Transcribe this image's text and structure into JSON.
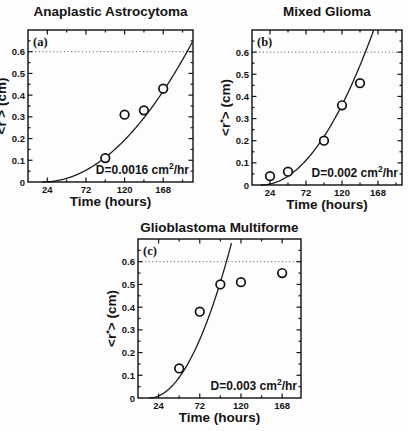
{
  "chart_data": [
    {
      "panel": "a",
      "panel_label": "(a)",
      "type": "scatter",
      "title": "Anaplastic Astrocytoma",
      "xlabel": "Time (hours)",
      "ylabel": "<r*> (cm)",
      "xlim": [
        0,
        205
      ],
      "ylim": [
        0,
        0.7
      ],
      "x_ticks": [
        24,
        72,
        120,
        168
      ],
      "y_ticks": [
        0,
        0.1,
        0.2,
        0.3,
        0.4,
        0.5,
        0.6
      ],
      "threshold_y": 0.6,
      "points": [
        {
          "t": 96,
          "r": 0.11
        },
        {
          "t": 120,
          "r": 0.31
        },
        {
          "t": 144,
          "r": 0.33
        },
        {
          "t": 168,
          "r": 0.43
        }
      ],
      "fit_curve": {
        "form": "r = a*(t-t0)^2",
        "t0": 18,
        "a": 1.86e-05
      },
      "annotation": {
        "text": "D=0.0016 cm^2/hr",
        "prefix": "D=0.0016 cm",
        "sup": "2",
        "suffix": "/hr"
      }
    },
    {
      "panel": "b",
      "panel_label": "(b)",
      "type": "scatter",
      "title": "Mixed Glioma",
      "xlabel": "Time (hours)",
      "ylabel": "<r*> (cm)",
      "xlim": [
        0,
        200
      ],
      "ylim": [
        0,
        0.7
      ],
      "x_ticks": [
        24,
        72,
        120,
        168
      ],
      "y_ticks": [
        0,
        0.1,
        0.2,
        0.3,
        0.4,
        0.5,
        0.6
      ],
      "threshold_y": 0.6,
      "points": [
        {
          "t": 24,
          "r": 0.04
        },
        {
          "t": 48,
          "r": 0.06
        },
        {
          "t": 96,
          "r": 0.2
        },
        {
          "t": 120,
          "r": 0.36
        },
        {
          "t": 144,
          "r": 0.46
        }
      ],
      "fit_curve": {
        "form": "r = a*(t-t0)^2",
        "t0": 12,
        "a": 3.1e-05
      },
      "annotation": {
        "text": "D=0.002 cm^2/hr",
        "prefix": "D=0.002 cm",
        "sup": "2",
        "suffix": "/hr"
      }
    },
    {
      "panel": "c",
      "panel_label": "(c)",
      "type": "scatter",
      "title": "Glioblastoma Multiforme",
      "xlabel": "Time (hours)",
      "ylabel": "<r*> (cm)",
      "xlim": [
        0,
        190
      ],
      "ylim": [
        0,
        0.7
      ],
      "x_ticks": [
        24,
        72,
        120,
        168
      ],
      "y_ticks": [
        0,
        0.1,
        0.2,
        0.3,
        0.4,
        0.5,
        0.6
      ],
      "threshold_y": 0.6,
      "points": [
        {
          "t": 48,
          "r": 0.13
        },
        {
          "t": 72,
          "r": 0.38
        },
        {
          "t": 96,
          "r": 0.5
        },
        {
          "t": 120,
          "r": 0.51
        },
        {
          "t": 168,
          "r": 0.55
        }
      ],
      "fit_curve": {
        "form": "r = a*(t-t0)^2",
        "t0": 13,
        "a": 7.4e-05
      },
      "annotation": {
        "text": "D=0.003 cm^2/hr",
        "prefix": "D=0.003 cm",
        "sup": "2",
        "suffix": "/hr"
      }
    }
  ]
}
